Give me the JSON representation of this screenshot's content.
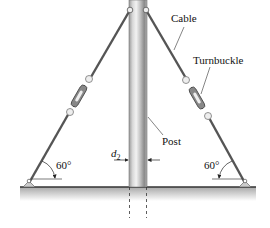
{
  "diagram": {
    "labels": {
      "cable": "Cable",
      "turnbuckle": "Turnbuckle",
      "post": "Post",
      "diameter_symbol": "d",
      "diameter_subscript": "2",
      "angle_left": "60°",
      "angle_right": "60°"
    },
    "components": [
      "post",
      "left-cable",
      "right-cable",
      "left-turnbuckle",
      "right-turnbuckle",
      "left-anchor",
      "right-anchor",
      "ground"
    ],
    "colors": {
      "cable": "#555555",
      "post_light": "#d8d8d8",
      "post_dark": "#8a8a8a",
      "ground_line": "#333333",
      "ground_fill": "#b8b8b8",
      "text": "#111111"
    }
  }
}
